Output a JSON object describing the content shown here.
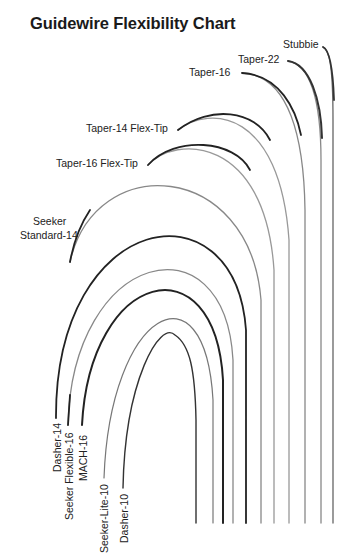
{
  "title": "Guidewire Flexibility Chart",
  "wires": [
    {
      "name": "Stubbie",
      "stroke": "#555555"
    },
    {
      "name": "Taper-22",
      "stroke": "#444444"
    },
    {
      "name": "Taper-16",
      "stroke": "#333333"
    },
    {
      "name": "Taper-14 Flex-Tip",
      "stroke": "#333333"
    },
    {
      "name": "Taper-16 Flex-Tip",
      "stroke": "#333333"
    },
    {
      "name": "Seeker Standard-14",
      "stroke": "#777777"
    },
    {
      "name": "Dasher-14",
      "stroke": "#222222"
    },
    {
      "name": "Seeker Flexible-16",
      "stroke": "#777777"
    },
    {
      "name": "MACH-16",
      "stroke": "#222222"
    },
    {
      "name": "Seeker-Lite-10",
      "stroke": "#666666"
    },
    {
      "name": "Dasher-10",
      "stroke": "#333333"
    }
  ],
  "labels": {
    "stubbie": "Stubbie",
    "taper22": "Taper-22",
    "taper16": "Taper-16",
    "taper14flex": "Taper-14 Flex-Tip",
    "taper16flex": "Taper-16 Flex-Tip",
    "seeker_line1": "Seeker",
    "seeker_line2": "Standard-14",
    "dasher14": "Dasher-14",
    "seekerflex16": "Seeker Flexible-16",
    "mach16": "MACH-16",
    "seekerlite10": "Seeker-Lite-10",
    "dasher10": "Dasher-10"
  }
}
